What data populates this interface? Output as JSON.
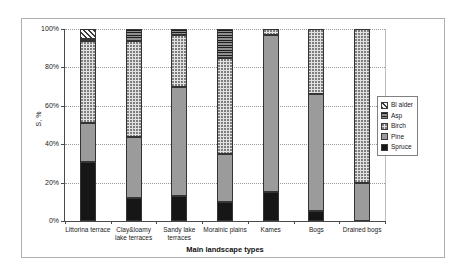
{
  "chart_data": {
    "type": "bar",
    "stacked": true,
    "percent_stacked": true,
    "title": "",
    "xlabel": "Main landscape types",
    "ylabel": "S, %",
    "ylim": [
      0,
      100
    ],
    "y_ticks": [
      "0%",
      "20%",
      "40%",
      "60%",
      "80%",
      "100%"
    ],
    "grid": "dotted horizontal gridlines at 20% steps",
    "legend_position": "right",
    "categories": [
      "Littorina terrace",
      "Clay&loamy\nlake terraces",
      "Sandy lake\nterraces",
      "Morainic plains",
      "Kames",
      "Bogs",
      "Drained bogs"
    ],
    "series": [
      {
        "name": "Spruce",
        "pattern": "solid-black",
        "color": "#161616",
        "values": [
          31,
          12,
          13,
          10,
          15,
          5,
          0
        ]
      },
      {
        "name": "Pine",
        "pattern": "solid-gray",
        "color": "#9b9b9b",
        "values": [
          20,
          32,
          57,
          25,
          82,
          61,
          20
        ]
      },
      {
        "name": "Birch",
        "pattern": "dots",
        "color": "#e2e2e2",
        "values": [
          43,
          50,
          27,
          50,
          3,
          34,
          80
        ]
      },
      {
        "name": "Asp",
        "pattern": "horizontal-stripes",
        "color": "#3c3c3c",
        "values": [
          1,
          6,
          3,
          15,
          0,
          0,
          0
        ]
      },
      {
        "name": "Bl alder",
        "pattern": "diagonal-hatch",
        "color": "#f6f6f6",
        "values": [
          5,
          0,
          0,
          0,
          0,
          0,
          0
        ]
      }
    ],
    "legend": [
      "Bl alder",
      "Asp",
      "Birch",
      "Pine",
      "Spruce"
    ]
  }
}
